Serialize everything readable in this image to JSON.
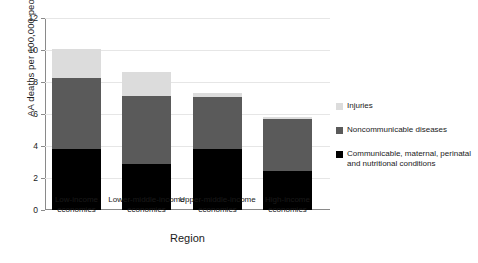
{
  "chart_data": {
    "type": "bar",
    "stacked": true,
    "title": "",
    "xlabel": "Region",
    "ylabel": "AA deaths per 100,000 people",
    "ylim": [
      0,
      12
    ],
    "yticks": [
      0,
      2,
      4,
      6,
      8,
      10,
      12
    ],
    "grid": true,
    "legend_position": "right",
    "categories": [
      "Low-income economies",
      "Lower-middle-income economies",
      "Upper-middle-income economies",
      "High-income economies"
    ],
    "series": [
      {
        "name": "Communicable, maternal, perinatal and nutritional conditions",
        "color": "#000000",
        "values": [
          1.8,
          1.55,
          0.25,
          0.1
        ]
      },
      {
        "name": "Noncommunicable diseases",
        "color": "#5a5a5a",
        "values": [
          4.45,
          4.2,
          3.25,
          3.25
        ]
      },
      {
        "name": "Injuries",
        "color": "#dcdcdc",
        "values": [
          3.8,
          2.9,
          3.8,
          2.45
        ]
      }
    ],
    "totals": [
      10.05,
      8.65,
      7.3,
      5.8
    ]
  },
  "axes": {
    "y_title": "AA deaths per 100,000 people",
    "x_title": "Region",
    "y_tick_labels": [
      "0",
      "2",
      "4",
      "6",
      "8",
      "10",
      "12"
    ],
    "x_tick_labels": [
      "Low-income economies",
      "Lower-middle-income economies",
      "Upper-middle-income economies",
      "High-income economies"
    ]
  },
  "legend": {
    "items": [
      {
        "label": "Injuries",
        "color": "#dcdcdc"
      },
      {
        "label": "Noncommunicable diseases",
        "color": "#5a5a5a"
      },
      {
        "label": "Communicable, maternal, perinatal and nutritional conditions",
        "color": "#000000"
      }
    ]
  }
}
